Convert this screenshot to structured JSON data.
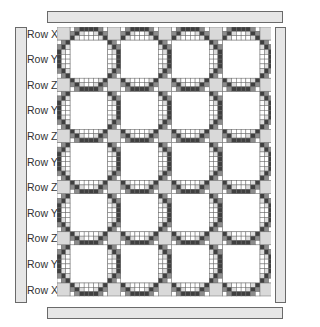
{
  "diagram": {
    "type": "quilt-layout",
    "row_labels": [
      "Row X",
      "Row Y",
      "Row Z",
      "Row Y",
      "Row Z",
      "Row Y",
      "Row Z",
      "Row Y",
      "Row Z",
      "Row Y",
      "Row X"
    ],
    "columns_of_blocks": 4,
    "rows_of_blocks": 5,
    "colors": {
      "bar_fill": "#e6e6e6",
      "bar_border": "#6a6a6a",
      "cornerstone": "#d9d9d9",
      "dark": "#3f3f3f",
      "medium": "#8c8c8c",
      "light": "#dcdcdc",
      "white": "#ffffff",
      "grid_line": "#6b6b6b"
    },
    "layout": {
      "corner": 13,
      "block_w": 37.75,
      "block_h": 38.2,
      "cells_along": 8,
      "cells_across": 3
    },
    "sashing_pattern": [
      [
        0,
        2,
        3,
        3,
        3,
        3,
        2,
        0
      ],
      [
        2,
        3,
        1,
        0,
        0,
        1,
        3,
        2
      ],
      [
        3,
        1,
        0,
        0,
        0,
        0,
        1,
        3
      ]
    ],
    "side_bars": {
      "top": {
        "x": 47,
        "y": 11,
        "w": 236,
        "h": 12
      },
      "bottom": {
        "x": 47,
        "y": 307,
        "w": 236,
        "h": 12
      },
      "left": {
        "x": 15,
        "y": 27,
        "w": 12,
        "h": 276
      },
      "right": {
        "x": 275,
        "y": 27,
        "w": 11,
        "h": 276
      }
    }
  }
}
